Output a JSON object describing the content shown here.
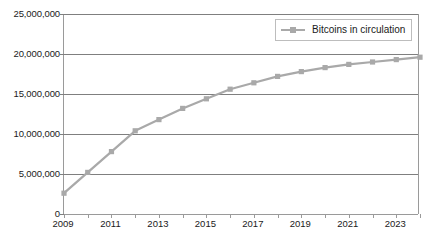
{
  "chart_data": {
    "type": "line",
    "title": "",
    "subtitle": "",
    "xlabel": "",
    "ylabel": "",
    "grid": true,
    "legend_position": "top-right",
    "legend": [
      "Bitcoins in circulation"
    ],
    "xlim": [
      2009,
      2024
    ],
    "ylim": [
      0,
      25000000
    ],
    "y_ticks": [
      0,
      5000000,
      10000000,
      15000000,
      20000000,
      25000000
    ],
    "y_tick_labels": [
      "0",
      "5,000,000",
      "10,000,000",
      "15,000,000",
      "20,000,000",
      "25,000,000"
    ],
    "x_ticks": [
      2009,
      2010,
      2011,
      2012,
      2013,
      2014,
      2015,
      2016,
      2017,
      2018,
      2019,
      2020,
      2021,
      2022,
      2023,
      2024
    ],
    "x_tick_labels": [
      "2009",
      "",
      "2011",
      "",
      "2013",
      "",
      "2015",
      "",
      "2017",
      "",
      "2019",
      "",
      "2021",
      "",
      "2023",
      ""
    ],
    "x_labels_visible": [
      "2009",
      "2011",
      "2013",
      "2015",
      "2017",
      "2019",
      "2021",
      "2023"
    ],
    "categories": [
      2009,
      2010,
      2011,
      2012,
      2013,
      2014,
      2015,
      2016,
      2017,
      2018,
      2019,
      2020,
      2021,
      2022,
      2023,
      2024
    ],
    "series": [
      {
        "name": "Bitcoins in circulation",
        "color": "#a9a9a9",
        "marker": "square",
        "values": [
          2600000,
          5200000,
          7800000,
          10400000,
          11800000,
          13200000,
          14400000,
          15600000,
          16400000,
          17200000,
          17800000,
          18300000,
          18700000,
          19000000,
          19300000,
          19600000
        ]
      }
    ]
  },
  "legend": {
    "entry_label": "Bitcoins in circulation"
  }
}
